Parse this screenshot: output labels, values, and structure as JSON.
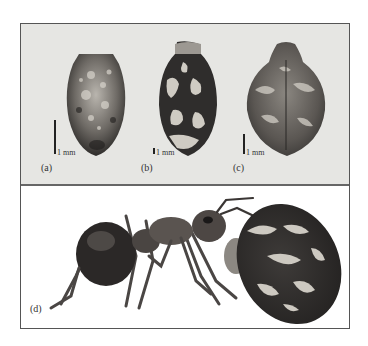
{
  "figure": {
    "panels": [
      {
        "id": "a",
        "label": "(a)",
        "scale_label": "1 mm",
        "subject": "seed-a"
      },
      {
        "id": "b",
        "label": "(b)",
        "scale_label": "1 mm",
        "subject": "seed-b"
      },
      {
        "id": "c",
        "label": "(c)",
        "scale_label": "1 mm",
        "subject": "seed-c"
      },
      {
        "id": "d",
        "label": "(d)",
        "subject": "ant-carrying-seed"
      }
    ],
    "colors": {
      "top_background": "#e6e6e3",
      "border": "#555555",
      "seed_dark": "#3a3836",
      "seed_light": "#c9c6c0",
      "ant_body": "#2e2b2a"
    }
  }
}
